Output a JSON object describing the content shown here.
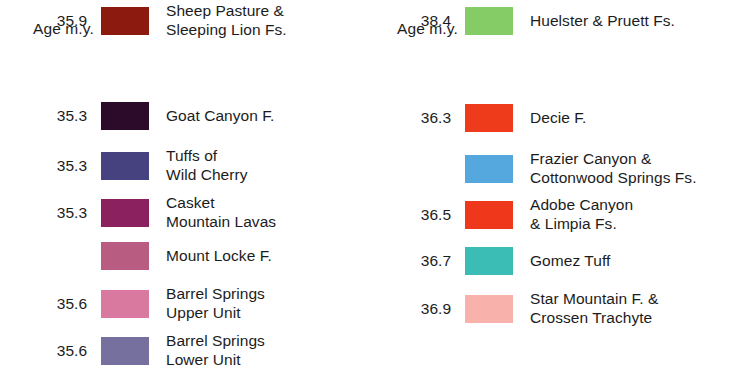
{
  "columns": [
    {
      "heading": "Age m.y.",
      "entries": [
        {
          "age": "35.3",
          "label": "Goat Canyon F.",
          "color": "#2b0b29"
        },
        {
          "age": "35.3",
          "label": "Tuffs of\nWild Cherry",
          "color": "#464280"
        },
        {
          "age": "35.3",
          "label": "Casket\nMountain Lavas",
          "color": "#8c2160"
        },
        {
          "age": "",
          "label": "Mount Locke F.",
          "color": "#b85c81"
        },
        {
          "age": "35.6",
          "label": "Barrel Springs\nUpper Unit",
          "color": "#da79a0"
        },
        {
          "age": "35.6",
          "label": "Barrel Springs\nLower Unit",
          "color": "#75709e"
        },
        {
          "age": "35.9",
          "label": "Sheep Pasture &\nSleeping Lion Fs.",
          "color": "#8d1a0f"
        }
      ]
    },
    {
      "heading": "Age m.y.",
      "entries": [
        {
          "age": "36.3",
          "label": "Decie F.",
          "color": "#ee3b1c"
        },
        {
          "age": "",
          "label": "Frazier Canyon &\nCottonwood Springs Fs.",
          "color": "#55a8dd"
        },
        {
          "age": "36.5",
          "label": "Adobe Canyon\n& Limpia Fs.",
          "color": "#ef381b"
        },
        {
          "age": "36.7",
          "label": "Gomez Tuff",
          "color": "#3bbcb4"
        },
        {
          "age": "36.9",
          "label": "Star Mountain F. &\nCrossen Trachyte",
          "color": "#f8b1ab"
        },
        {
          "age": "38.4",
          "label": "Huelster & Pruett Fs.",
          "color": "#85cc66"
        }
      ]
    }
  ]
}
